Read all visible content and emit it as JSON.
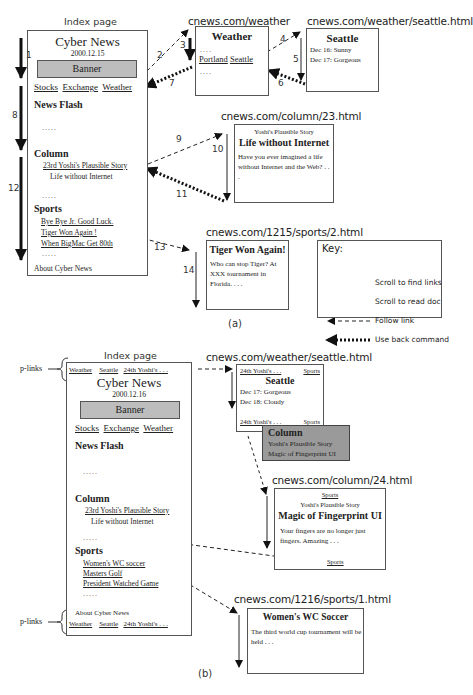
{
  "part_a": {
    "caption": "(a)",
    "index_label": "Index page",
    "index": {
      "title": "Cyber News",
      "date": "2000.12.15",
      "banner": "Banner",
      "nav_links": [
        "Stocks",
        "Exchange",
        "Weather"
      ],
      "news_flash": "News Flash",
      "dots": ".....",
      "column_heading": "Column",
      "column_link": "23rd Yoshi's Plausible Story",
      "column_sub": "Life without Internet",
      "sports_heading": "Sports",
      "sports_links": [
        "Bye Bye Jr. Good Luck.",
        "Tiger Won Again !",
        "When BigMac Get 80th"
      ],
      "footer": "About Cyber News"
    },
    "weather_page": {
      "url": "cnews.com/weather",
      "title": "Weather",
      "dots": "....",
      "links": [
        "Portland",
        "Seattle"
      ]
    },
    "seattle_page": {
      "url": "cnews.com/weather/seattle.html",
      "title": "Seattle",
      "lines": [
        "Dec 16:  Sunny",
        "Dec 17:  Gorgeous"
      ]
    },
    "column_page": {
      "url": "cnews.com/column/23.html",
      "kicker": "Yoshi's Plausible Story",
      "title": "Life without Internet",
      "body": "Have you ever imagined a life without Internet and the Web? . . ."
    },
    "sports_page": {
      "url": "cnews.com/1215/sports/2.html",
      "title": "Tiger Won Again!",
      "body": "Who can stop Tiger? At XXX tournament in Florida. . . ."
    },
    "step_numbers": [
      "1",
      "2",
      "3",
      "4",
      "5",
      "6",
      "7",
      "8",
      "9",
      "10",
      "11",
      "12",
      "13",
      "14"
    ],
    "key": {
      "title": "Key:",
      "items": [
        {
          "label": "Scroll to find links",
          "style": "thick-solid"
        },
        {
          "label": "Scroll to read doc",
          "style": "thin-solid"
        },
        {
          "label": "Follow link",
          "style": "dashed"
        },
        {
          "label": "Use back command",
          "style": "thick-dotted"
        }
      ]
    }
  },
  "part_b": {
    "caption": "(b)",
    "index_label": "Index page",
    "plinks_label": "p-links",
    "plinks": [
      "Weather",
      "Seattle",
      "24th Yoshi's . . ."
    ],
    "index": {
      "title": "Cyber News",
      "date": "2000.12.16",
      "banner": "Banner",
      "nav_links": [
        "Stocks",
        "Exchange",
        "Weather"
      ],
      "news_flash": "News Flash",
      "dots": ".....",
      "column_heading": "Column",
      "column_link": "23rd Yoshi's Plausible Story",
      "column_sub": "Life without Internet",
      "sports_heading": "Sports",
      "sports_links": [
        "Women's WC soccer",
        "Masters Golf",
        "President Watched Game"
      ],
      "footer": "About Cyber News"
    },
    "seattle_page": {
      "url": "cnews.com/weather/seattle.html",
      "top_links": [
        "24th Yoshi's . . .",
        "Sports"
      ],
      "title": "Seattle",
      "lines": [
        "Dec 17: Gorgeous",
        "Dec 18: Cloudy"
      ],
      "bottom_links": [
        "24th Yoshi's . . .",
        "Sports"
      ]
    },
    "popup": {
      "title": "Column",
      "lines": [
        "Yoshi's Plausible Story",
        "Magic of Fingerprint UI"
      ]
    },
    "column_page": {
      "url": "cnews.com/column/24.html",
      "top_link": "Sports",
      "kicker": "Yoshi's Plausible Story",
      "title": "Magic of Fingerprint UI",
      "body": "Your fingers are no longer just fingers. Amazing . . .",
      "bottom_link": "Sports"
    },
    "sports_page": {
      "url": "cnews.com/1216/sports/1.html",
      "title": "Women's WC Soccer",
      "body": "The third world cup tournament will be held . . ."
    }
  }
}
